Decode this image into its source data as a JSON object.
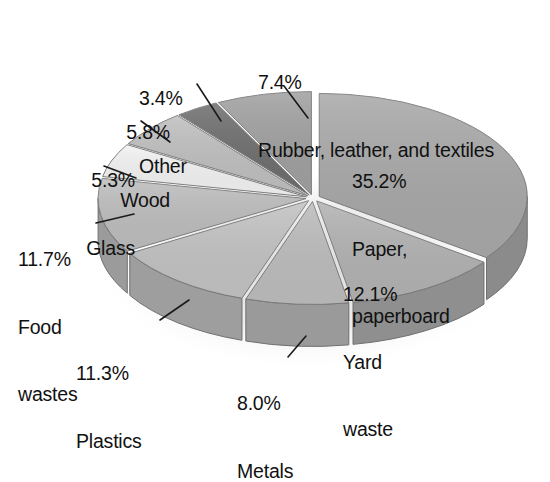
{
  "chart_data": {
    "type": "pie",
    "title": "",
    "subtitle": "",
    "xlabel": "",
    "ylabel": "",
    "legend_position": "none",
    "grid": false,
    "style": "3d-exploded-grayscale",
    "units": "percent",
    "total": 100.2,
    "categories": [
      "Paper, paperboard",
      "Yard waste",
      "Metals",
      "Plastics",
      "Food wastes",
      "Glass",
      "Wood",
      "Other",
      "Rubber, leather, and textiles"
    ],
    "values": [
      35.2,
      12.1,
      8.0,
      11.3,
      11.7,
      5.3,
      5.8,
      3.4,
      7.4
    ],
    "slices": [
      {
        "id": "paper",
        "name": "Paper, paperboard",
        "pct_label": "35.2%",
        "value": 35.2,
        "name_lines": [
          "Paper,",
          "paperboard"
        ],
        "label_placement": "inside",
        "fill": "#a8a8a8",
        "side": "#8b8b8b"
      },
      {
        "id": "yard",
        "name": "Yard waste",
        "pct_label": "12.1%",
        "value": 12.1,
        "name_lines": [
          "Yard",
          "waste"
        ],
        "label_placement": "inside",
        "fill": "#b2b2b2",
        "side": "#8f8f8f"
      },
      {
        "id": "metals",
        "name": "Metals",
        "pct_label": "8.0%",
        "value": 8.0,
        "name_lines": [
          "Metals"
        ],
        "label_placement": "outside-leader",
        "fill": "#bcbcbc",
        "side": "#9a9a9a"
      },
      {
        "id": "plastics",
        "name": "Plastics",
        "pct_label": "11.3%",
        "value": 11.3,
        "name_lines": [
          "Plastics"
        ],
        "label_placement": "outside-leader",
        "fill": "#c2c2c2",
        "side": "#9e9e9e"
      },
      {
        "id": "food",
        "name": "Food wastes",
        "pct_label": "11.7%",
        "value": 11.7,
        "name_lines": [
          "Food",
          "wastes"
        ],
        "label_placement": "outside-leader",
        "fill": "#bdbdbd",
        "side": "#9b9b9b"
      },
      {
        "id": "glass",
        "name": "Glass",
        "pct_label": "5.3%",
        "value": 5.3,
        "name_lines": [
          "Glass"
        ],
        "label_placement": "outside-leader",
        "fill": "#f2f2f2",
        "side": "#d2d2d2"
      },
      {
        "id": "wood",
        "name": "Wood",
        "pct_label": "5.8%",
        "value": 5.8,
        "name_lines": [
          "Wood"
        ],
        "label_placement": "outside-leader",
        "fill": "#bfbfbf",
        "side": "#9d9d9d"
      },
      {
        "id": "other",
        "name": "Other",
        "pct_label": "3.4%",
        "value": 3.4,
        "name_lines": [
          "Other"
        ],
        "label_placement": "outside-leader",
        "fill": "#6e6e6e",
        "side": "#585858"
      },
      {
        "id": "rubber",
        "name": "Rubber, leather, and textiles",
        "pct_label": "7.4%",
        "value": 7.4,
        "name_lines": [
          "Rubber, leather, and textiles"
        ],
        "label_placement": "outside-leader",
        "fill": "#a0a0a0",
        "side": "#848484"
      }
    ],
    "colors": {
      "background": "#ffffff",
      "text": "#111111",
      "leader_line": "#1a1a1a",
      "shadow": "#e3e3e3"
    }
  },
  "labels": {
    "paper": {
      "pct": "35.2%",
      "l1": "Paper,",
      "l2": "paperboard"
    },
    "yard": {
      "pct": "12.1%",
      "l1": "Yard",
      "l2": "waste"
    },
    "metals": {
      "pct": "8.0%",
      "l1": "Metals"
    },
    "plastics": {
      "pct": "11.3%",
      "l1": "Plastics"
    },
    "food": {
      "pct": "11.7%",
      "l1": "Food",
      "l2": "wastes"
    },
    "glass": {
      "pct": "5.3%",
      "l1": "Glass"
    },
    "wood": {
      "pct": "5.8%",
      "l1": "Wood"
    },
    "other": {
      "pct": "3.4%",
      "l1": "Other"
    },
    "rubber": {
      "pct": "7.4%",
      "l1": "Rubber, leather, and textiles"
    }
  }
}
